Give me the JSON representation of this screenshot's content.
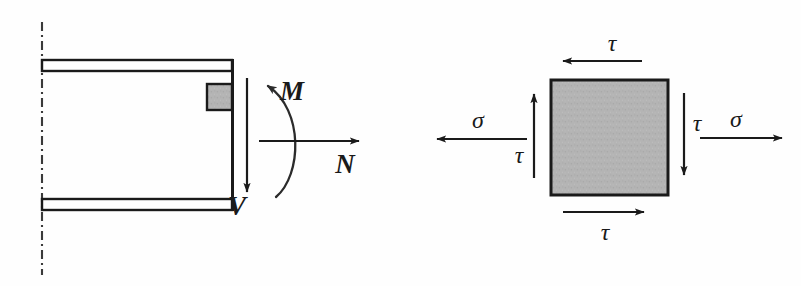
{
  "figure": {
    "colors": {
      "line": "#1a1a1a",
      "element_fill": "#b3b3b3",
      "element_stroke": "#1a1a1a",
      "centerline": "#3a3a3a",
      "background": "#fefefe"
    }
  },
  "beam_diagram": {
    "name": "cantilever-beam-section",
    "centerline": {
      "label": "symmetry-centerline",
      "style": "dash-dot",
      "x": 42,
      "y_top": 22,
      "y_bottom": 275
    },
    "flanges": [
      {
        "name": "top-flange",
        "x": 42,
        "y": 60,
        "width": 190,
        "height": 11
      },
      {
        "name": "bottom-flange",
        "x": 42,
        "y": 199,
        "width": 190,
        "height": 11
      }
    ],
    "web_edge": {
      "name": "cut-face-edge",
      "x": 232,
      "y_top": 60,
      "y_bottom": 210
    },
    "stress_element_marker": {
      "name": "stress-element-location",
      "x": 207,
      "y": 84,
      "width": 25,
      "height": 26
    },
    "forces": [
      {
        "symbol": "V",
        "name": "shear-force",
        "kind": "straight-arrow",
        "direction": "down",
        "label_x": 243,
        "label_y": 215
      },
      {
        "symbol": "M",
        "name": "bending-moment",
        "kind": "curved-arrow",
        "direction": "counterclockwise",
        "label_x": 288,
        "label_y": 98
      },
      {
        "symbol": "N",
        "name": "axial-force",
        "kind": "straight-arrow",
        "direction": "right",
        "label_x": 345,
        "label_y": 170
      }
    ]
  },
  "stress_element": {
    "name": "stress-element-square",
    "square": {
      "x": 551,
      "y": 80,
      "width": 117,
      "height": 115
    },
    "stresses": [
      {
        "symbol": "τ",
        "name": "shear-stress-top",
        "face": "top",
        "direction": "left",
        "label_x": 612,
        "label_y": 51
      },
      {
        "symbol": "τ",
        "name": "shear-stress-bottom",
        "face": "bottom",
        "direction": "right",
        "label_x": 605,
        "label_y": 240
      },
      {
        "symbol": "τ",
        "name": "shear-stress-left",
        "face": "left",
        "direction": "up",
        "label_x": 514,
        "label_y": 163
      },
      {
        "symbol": "τ",
        "name": "shear-stress-right",
        "face": "right",
        "direction": "down",
        "label_x": 690,
        "label_y": 130
      },
      {
        "symbol": "σ",
        "name": "normal-stress-left",
        "face": "left",
        "direction": "left",
        "label_x": 470,
        "label_y": 130
      },
      {
        "symbol": "σ",
        "name": "normal-stress-right",
        "face": "right",
        "direction": "right",
        "label_x": 728,
        "label_y": 129
      }
    ]
  }
}
